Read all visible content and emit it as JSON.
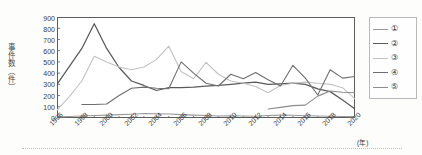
{
  "axes": {
    "ylabel": "事件数（件）",
    "xunit": "(年)",
    "yticks": [
      "900",
      "800",
      "700",
      "600",
      "500",
      "400",
      "300",
      "200",
      "100",
      "0"
    ],
    "xticks": [
      "1996",
      "1998",
      "2000",
      "2002",
      "2004",
      "2006",
      "2008",
      "2010",
      "2012",
      "2014",
      "2016",
      "2018",
      "2020"
    ]
  },
  "legend": {
    "items": [
      {
        "label": "①",
        "color": "#9a9a9a"
      },
      {
        "label": "②",
        "color": "#5a5a5a"
      },
      {
        "label": "③",
        "color": "#c2c2c2"
      },
      {
        "label": "④",
        "color": "#6f6f6f"
      },
      {
        "label": "⑤",
        "color": "#8c8c8c"
      }
    ]
  },
  "chart_data": {
    "type": "line",
    "title": "",
    "xlabel": "(年)",
    "ylabel": "事件数（件）",
    "xlim": [
      1996,
      2020
    ],
    "ylim": [
      0,
      900
    ],
    "ytick_step": 100,
    "xtick_step": 2,
    "grid": false,
    "legend_position": "right",
    "x": [
      1996,
      1997,
      1998,
      1999,
      2000,
      2001,
      2002,
      2003,
      2004,
      2005,
      2006,
      2007,
      2008,
      2009,
      2010,
      2011,
      2012,
      2013,
      2014,
      2015,
      2016,
      2017,
      2018,
      2019,
      2020
    ],
    "series": [
      {
        "name": "①",
        "color": "#9a9a9a",
        "values": [
          10,
          14,
          18,
          22,
          26,
          30,
          34,
          40,
          38,
          36,
          30,
          26,
          22,
          18,
          20,
          18,
          16,
          22,
          26,
          24,
          20,
          18,
          16,
          14,
          12
        ]
      },
      {
        "name": "②",
        "color": "#5a5a5a",
        "values": [
          300,
          460,
          620,
          840,
          620,
          450,
          330,
          290,
          245,
          270,
          270,
          275,
          285,
          290,
          300,
          310,
          320,
          300,
          305,
          310,
          300,
          260,
          235,
          160,
          80
        ]
      },
      {
        "name": "③",
        "color": "#c2c2c2",
        "values": [
          70,
          190,
          330,
          550,
          500,
          455,
          430,
          455,
          520,
          640,
          415,
          350,
          495,
          390,
          330,
          310,
          280,
          225,
          290,
          310,
          320,
          310,
          300,
          270,
          170
        ]
      },
      {
        "name": "④",
        "color": "#6f6f6f",
        "values": [
          null,
          null,
          120,
          120,
          125,
          200,
          265,
          275,
          265,
          260,
          500,
          400,
          310,
          285,
          390,
          350,
          405,
          340,
          285,
          470,
          355,
          205,
          430,
          355,
          370
        ]
      },
      {
        "name": "⑤",
        "color": "#8c8c8c",
        "values": [
          null,
          null,
          null,
          null,
          null,
          null,
          null,
          null,
          null,
          null,
          null,
          null,
          null,
          null,
          null,
          null,
          null,
          80,
          95,
          110,
          115,
          195,
          240,
          230,
          225
        ]
      }
    ]
  }
}
